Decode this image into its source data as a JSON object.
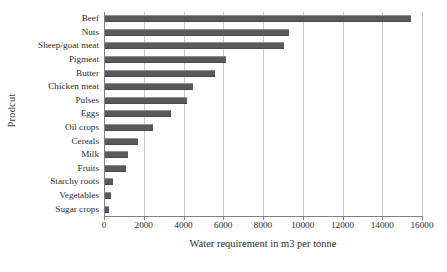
{
  "chart_data": {
    "type": "bar",
    "orientation": "horizontal",
    "title": "",
    "xlabel": "Water requirement in m3 per tonne",
    "ylabel": "Prodcut",
    "xlim": [
      0,
      16000
    ],
    "xticks": [
      0,
      2000,
      4000,
      6000,
      8000,
      10000,
      12000,
      14000,
      16000
    ],
    "xtick_labels": [
      "0",
      "2000",
      "4000",
      "6000",
      "8000",
      "10000",
      "12000",
      "14000",
      "16000"
    ],
    "grid": "vertical",
    "legend": "none",
    "bar_color": "#595959",
    "gridline_color": "#c9c9c9",
    "axis_color": "#808080",
    "categories": [
      "Beef",
      "Nuts",
      "Sheep/goat meat",
      "Pigmeat",
      "Butter",
      "Chicken meat",
      "Pulses",
      "Eggs",
      "Oil crops",
      "Cereals",
      "Milk",
      "Fruits",
      "Starchy roots",
      "Vegetables",
      "Sugar crops"
    ],
    "values": [
      15400,
      9250,
      9000,
      6100,
      5550,
      4450,
      4150,
      3300,
      2400,
      1650,
      1150,
      1050,
      380,
      320,
      200
    ]
  }
}
